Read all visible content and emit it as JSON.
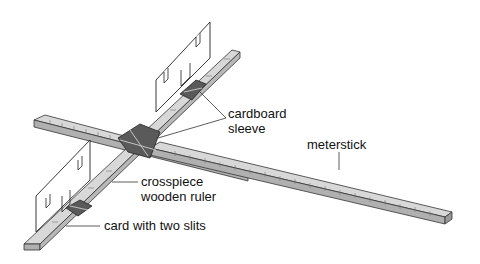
{
  "diagram": {
    "labels": {
      "cardboard_sleeve_line1": "cardboard",
      "cardboard_sleeve_line2": "sleeve",
      "meterstick": "meterstick",
      "crosspiece_line1": "crosspiece",
      "crosspiece_line2": "wooden ruler",
      "card": "card with two slits"
    },
    "colors": {
      "ruler_fill": "#d4d4d4",
      "ruler_edge": "#a8a8a8",
      "sleeve_dark": "#555555",
      "outline": "#333333"
    }
  }
}
